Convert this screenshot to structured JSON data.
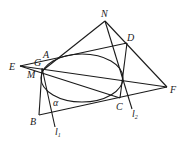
{
  "diagram": {
    "type": "conic-geometry",
    "curve": {
      "shape": "ellipse",
      "cx": 82,
      "cy": 78,
      "rx": 41,
      "ry": 24
    },
    "points": {
      "N": {
        "label": "N",
        "x": 105,
        "y": 21
      },
      "D": {
        "label": "D",
        "x": 127,
        "y": 43
      },
      "F": {
        "label": "F",
        "x": 167,
        "y": 87
      },
      "E": {
        "label": "E",
        "x": 20,
        "y": 66
      },
      "A": {
        "label": "A",
        "x": 45,
        "y": 60
      },
      "G": {
        "label": "G",
        "x": 41,
        "y": 63
      },
      "M": {
        "label": "M",
        "x": 42,
        "y": 71
      },
      "B": {
        "label": "B",
        "x": 39,
        "y": 115
      },
      "C": {
        "label": "C",
        "x": 120,
        "y": 98
      }
    },
    "lines": {
      "l1": {
        "label": "l",
        "subscript": "1"
      },
      "l2": {
        "label": "l",
        "subscript": "2"
      }
    },
    "angle": {
      "label": "α"
    }
  }
}
